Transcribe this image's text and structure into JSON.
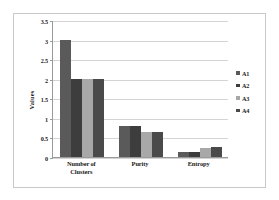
{
  "chart_data": {
    "type": "bar",
    "title": "",
    "xlabel": "",
    "ylabel": "Values",
    "categories": [
      "Number of Clusters",
      "Purity",
      "Entropy"
    ],
    "series": [
      {
        "name": "A1",
        "color": "#5a5a5a",
        "values": [
          3,
          0.8,
          0.12
        ]
      },
      {
        "name": "A2",
        "color": "#3d3d3d",
        "values": [
          2,
          0.78,
          0.14
        ]
      },
      {
        "name": "A3",
        "color": "#a8a8a8",
        "values": [
          2,
          0.65,
          0.24
        ]
      },
      {
        "name": "A4",
        "color": "#4a4a4a",
        "values": [
          2,
          0.65,
          0.25
        ]
      }
    ],
    "ylim": [
      0,
      3.5
    ],
    "yticks": [
      0,
      0.5,
      1,
      1.5,
      2,
      2.5,
      3,
      3.5
    ],
    "ytick_labels": [
      "0",
      "0.5",
      "1",
      "1.5",
      "2",
      "2.5",
      "3",
      "3.5"
    ],
    "grid": true,
    "legend_position": "right",
    "legend_entries": [
      "A1",
      "A2",
      "A3",
      "A4"
    ],
    "background_color": "#ffffff",
    "gridline_color": "#d4d4d4",
    "axis_color": "#9a9a9a",
    "frame_color": "#c9c9c9"
  }
}
